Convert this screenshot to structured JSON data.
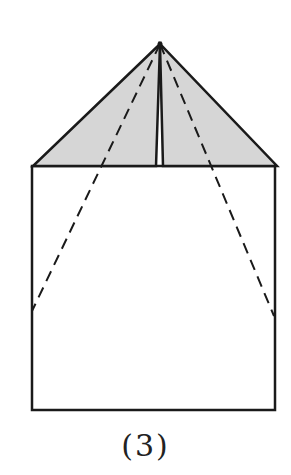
{
  "figure": {
    "caption": "(3)",
    "colors": {
      "stroke": "#1a1a1a",
      "fill": "#d6d6d6",
      "background": "#ffffff"
    },
    "apex": [
      160,
      44
    ],
    "rectangle": {
      "x": 32,
      "y": 166,
      "width": 243,
      "height": 244
    },
    "left_flap": {
      "points": [
        [
          160,
          44
        ],
        [
          33,
          166
        ],
        [
          156,
          166
        ]
      ]
    },
    "right_flap": {
      "points": [
        [
          160,
          44
        ],
        [
          163,
          166
        ],
        [
          277,
          166
        ]
      ]
    },
    "fold_lines": [
      {
        "type": "dashed",
        "from": [
          160,
          44
        ],
        "to": [
          32,
          311
        ]
      },
      {
        "type": "dashed",
        "from": [
          160,
          44
        ],
        "to": [
          274,
          316
        ]
      }
    ]
  }
}
